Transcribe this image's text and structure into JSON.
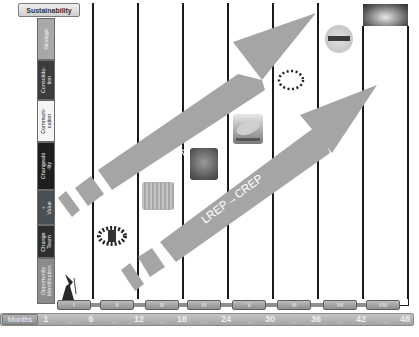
{
  "title_box": "Sustainability",
  "stages": [
    {
      "label": "Strategic",
      "bg": "#a8a8a8",
      "color": "#f4f4f4"
    },
    {
      "label": "Consolida-\ntion",
      "bg": "#3c3c3c",
      "color": "#eaeaea"
    },
    {
      "label": "Communi-\ncation",
      "bg": "#f5f5f5",
      "color": "#222222"
    },
    {
      "label": "Changeabi\n-lity",
      "bg": "#1e1e1e",
      "color": "#f0f0f0"
    },
    {
      "label": "+\nValue",
      "bg": "#4a4f56",
      "color": "#e6e6e6"
    },
    {
      "label": "Change\nTeam",
      "bg": "#2e2e2e",
      "color": "#eeeeee"
    },
    {
      "label": "Opportunity\nIdentification",
      "bg": "#8c8c8c",
      "color": "#efefef"
    }
  ],
  "arrows": {
    "upper": {
      "label": "NIRD→NIRD+",
      "color": "#a3a3a3"
    },
    "lower": {
      "label": "LREP→CREP",
      "color": "#a3a3a3"
    }
  },
  "phases": [
    "I",
    "II",
    "III",
    "IV",
    "V",
    "VI",
    "VII",
    "VIII"
  ],
  "months": {
    "label": "Months",
    "ticks": [
      "1",
      "6",
      "12",
      "18",
      "24",
      "30",
      "36",
      "42",
      "48"
    ],
    "separator": "..."
  },
  "images": [
    {
      "name": "wizard-figure"
    },
    {
      "name": "team-circle"
    },
    {
      "name": "cube-grid"
    },
    {
      "name": "crowd-face"
    },
    {
      "name": "airship"
    },
    {
      "name": "people-ring"
    },
    {
      "name": "globe-badge"
    },
    {
      "name": "horizon-2020-banner"
    }
  ]
}
